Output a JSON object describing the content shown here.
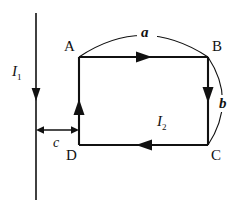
{
  "figure": {
    "kind": "physics-circuit-diagram",
    "stroke_color": "#111111",
    "background_color": "#ffffff"
  },
  "wire": {
    "name": "long-straight-wire",
    "current_label": "I",
    "current_subscript": "1",
    "direction": "downward"
  },
  "loop": {
    "name": "rectangular-loop",
    "current_label": "I",
    "current_subscript": "2",
    "direction": "clockwise",
    "corners": [
      {
        "id": "A",
        "label": "A",
        "position": "top-left"
      },
      {
        "id": "B",
        "label": "B",
        "position": "top-right"
      },
      {
        "id": "C",
        "label": "C",
        "position": "bottom-right"
      },
      {
        "id": "D",
        "label": "D",
        "position": "bottom-left"
      }
    ]
  },
  "dimensions": [
    {
      "id": "a",
      "label": "a",
      "kind": "arc-span",
      "spans": "A-to-B"
    },
    {
      "id": "b",
      "label": "b",
      "kind": "arc-span",
      "spans": "B-to-C"
    },
    {
      "id": "c",
      "label": "c",
      "kind": "linear-gap",
      "spans": "wire-to-loop"
    }
  ]
}
